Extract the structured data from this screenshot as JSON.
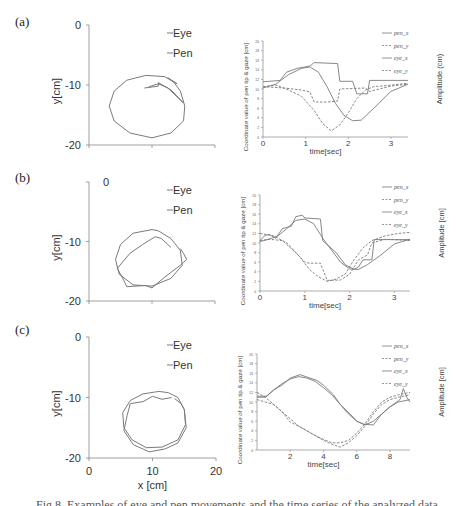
{
  "figure": {
    "caption": "Fig.8. Examples of eye and pen movements and the time series of the analyzed data"
  },
  "panels": [
    {
      "label": "(a)"
    },
    {
      "label": "(b)"
    },
    {
      "label": "(c)"
    }
  ],
  "chart_data": [
    {
      "id": "a-trajectory",
      "type": "line",
      "title": "",
      "xlabel": "",
      "ylabel": "y[cm]",
      "xlim": [
        0,
        20
      ],
      "ylim": [
        -20,
        0
      ],
      "yticks": [
        "0",
        "-10",
        "-20"
      ],
      "xticks": [],
      "legend": [
        "Eye",
        "Pen"
      ],
      "legend_position": "upper-right",
      "series": [
        {
          "name": "Pen",
          "points": [
            [
              14,
              -9.8
            ],
            [
              12,
              -8.6
            ],
            [
              9,
              -8.4
            ],
            [
              6,
              -9.2
            ],
            [
              4,
              -11
            ],
            [
              3.2,
              -13.5
            ],
            [
              4,
              -16
            ],
            [
              6.5,
              -18
            ],
            [
              10,
              -18.8
            ],
            [
              13,
              -18
            ],
            [
              15,
              -16
            ],
            [
              15.2,
              -13.5
            ],
            [
              14.5,
              -11
            ],
            [
              13.5,
              -9.6
            ],
            [
              12.5,
              -8.8
            ]
          ]
        },
        {
          "name": "Eye",
          "points": [
            [
              8.8,
              -10.5
            ],
            [
              11,
              -10.2
            ],
            [
              11,
              -9.6
            ],
            [
              13,
              -10.8
            ],
            [
              15,
              -13
            ],
            [
              12.5,
              -10.5
            ],
            [
              11,
              -9.8
            ],
            [
              9.5,
              -10.3
            ]
          ]
        }
      ]
    },
    {
      "id": "a-timeseries",
      "type": "line",
      "title": "",
      "xlabel": "time[sec]",
      "ylabel": "Coordinate value of pen tip & gaze [cm]",
      "ylabel_right": "Amplitude (cm)",
      "xlim": [
        0,
        3.4
      ],
      "ylim": [
        0,
        20
      ],
      "xticks": [
        "0",
        "1",
        "2",
        "3"
      ],
      "yticks": [
        "0",
        "2",
        "4",
        "6",
        "8",
        "10",
        "12",
        "14",
        "16",
        "18",
        "20"
      ],
      "legend": [
        "pen_x",
        "pen_y",
        "eye_x",
        "eye_y"
      ],
      "legend_position": "upper-right",
      "series": [
        {
          "name": "pen_x",
          "style": "solid",
          "x": [
            0,
            0.4,
            0.55,
            0.8,
            1.1,
            1.2,
            1.75,
            1.8,
            2.1,
            2.2,
            2.45,
            2.5,
            3,
            3.4
          ],
          "values": [
            11.5,
            11.8,
            13.5,
            14.3,
            14.8,
            15.5,
            15.3,
            11.6,
            11.6,
            9,
            9,
            11.8,
            11.8,
            11.8
          ]
        },
        {
          "name": "pen_y",
          "style": "dashed",
          "x": [
            0,
            0.5,
            0.9,
            1.1,
            1.2,
            1.5,
            1.75,
            1.8,
            2.4,
            2.5,
            3,
            3.4
          ],
          "values": [
            10.5,
            10.2,
            9.8,
            9.4,
            7.3,
            7.3,
            7.5,
            10,
            10.2,
            9.5,
            10.6,
            11
          ]
        },
        {
          "name": "eye_x",
          "style": "solid",
          "x": [
            0,
            0.3,
            0.6,
            0.9,
            1.1,
            1.3,
            1.5,
            1.7,
            1.9,
            2.1,
            2.3,
            2.6,
            3,
            3.4
          ],
          "values": [
            10.2,
            11,
            13,
            14.3,
            14.6,
            13.5,
            10.5,
            7,
            4.5,
            3.4,
            3.5,
            6,
            9.5,
            11
          ]
        },
        {
          "name": "eye_y",
          "style": "dashed",
          "x": [
            0,
            0.3,
            0.6,
            0.9,
            1.2,
            1.4,
            1.6,
            1.8,
            2.0,
            2.2,
            2.4,
            2.6,
            3,
            3.4
          ],
          "values": [
            10.5,
            10.8,
            9.8,
            8.5,
            5.5,
            2.8,
            1.3,
            2.5,
            5,
            8,
            9.8,
            10.5,
            10.8,
            11.2
          ]
        }
      ]
    },
    {
      "id": "b-trajectory",
      "type": "line",
      "title": "",
      "xlabel": "",
      "ylabel": "y[cm]",
      "xlim": [
        0,
        20
      ],
      "ylim": [
        -20,
        0
      ],
      "yticks": [
        "0",
        "-10",
        "-20"
      ],
      "xticks": [],
      "legend": [
        "Eye",
        "Pen"
      ],
      "legend_position": "upper-right",
      "series": [
        {
          "name": "Pen",
          "points": [
            [
              10,
              -8
            ],
            [
              7,
              -8.6
            ],
            [
              5,
              -10.5
            ],
            [
              4.2,
              -13
            ],
            [
              4.8,
              -15.5
            ],
            [
              7,
              -17.3
            ],
            [
              10,
              -17.5
            ],
            [
              13,
              -16.2
            ],
            [
              14.8,
              -14
            ],
            [
              14.5,
              -11.5
            ],
            [
              13,
              -9.5
            ],
            [
              11,
              -8.2
            ]
          ]
        },
        {
          "name": "Eye",
          "points": [
            [
              13,
              -11
            ],
            [
              11.5,
              -9.5
            ],
            [
              10.5,
              -9.2
            ],
            [
              8.5,
              -10.5
            ],
            [
              6.5,
              -12
            ],
            [
              4.5,
              -14.5
            ],
            [
              5.5,
              -16.5
            ],
            [
              6,
              -17.6
            ],
            [
              9,
              -17.4
            ],
            [
              10,
              -17.8
            ],
            [
              12,
              -16
            ],
            [
              14.5,
              -14
            ],
            [
              15.5,
              -13
            ],
            [
              15,
              -12
            ],
            [
              14.5,
              -11.2
            ]
          ]
        }
      ]
    },
    {
      "id": "b-timeseries",
      "type": "line",
      "title": "",
      "xlabel": "time[sec]",
      "ylabel": "Coordinate value of pen tip & gaze [cm]",
      "ylabel_right": "Amplitude [cm]",
      "xlim": [
        0,
        3.35
      ],
      "ylim": [
        0,
        20
      ],
      "xticks": [
        "0",
        "1",
        "2",
        "3"
      ],
      "yticks": [
        "0",
        "2",
        "4",
        "6",
        "8",
        "10",
        "12",
        "14",
        "16",
        "18",
        "20"
      ],
      "legend": [
        "pen_x",
        "pen_y",
        "eye_x",
        "eye_y"
      ],
      "legend_position": "upper-right",
      "series": [
        {
          "name": "pen_x",
          "style": "solid",
          "x": [
            0,
            0.1,
            0.2,
            0.35,
            0.5,
            0.7,
            0.8,
            0.95,
            1.0,
            1.35,
            1.4,
            1.7,
            1.9,
            2.1,
            2.2,
            2.3,
            2.5,
            2.55,
            3,
            3.35
          ],
          "values": [
            10.5,
            11.5,
            11.8,
            11,
            13,
            13.5,
            15.5,
            15.8,
            15.2,
            15,
            10.5,
            8,
            5.5,
            4.5,
            5,
            6.5,
            6.5,
            10.7,
            10.7,
            10.7
          ]
        },
        {
          "name": "pen_y",
          "style": "dashed",
          "x": [
            0,
            0.2,
            0.5,
            0.8,
            1.0,
            1.1,
            1.35,
            1.5,
            1.8,
            2.0,
            2.2,
            2.4,
            2.5,
            2.8,
            3.35
          ],
          "values": [
            10.5,
            10.8,
            10.5,
            8,
            6,
            5.8,
            5.8,
            2.2,
            2.3,
            3.5,
            6.5,
            7.5,
            10,
            10.8,
            10.5
          ]
        },
        {
          "name": "eye_x",
          "style": "solid",
          "x": [
            0,
            0.2,
            0.4,
            0.6,
            0.8,
            1.0,
            1.2,
            1.4,
            1.6,
            1.8,
            2.0,
            2.2,
            2.4,
            2.7,
            3.0,
            3.35
          ],
          "values": [
            10.3,
            10.8,
            11.5,
            13,
            14.7,
            15,
            14,
            11,
            8.5,
            6,
            4.6,
            4.5,
            5.5,
            7.5,
            9.8,
            10.8
          ]
        },
        {
          "name": "eye_y",
          "style": "dashed",
          "x": [
            0,
            0.3,
            0.6,
            0.9,
            1.1,
            1.3,
            1.5,
            1.7,
            1.9,
            2.1,
            2.3,
            2.5,
            2.8,
            3.1,
            3.35
          ],
          "values": [
            12,
            11.5,
            10,
            7,
            4.5,
            3,
            2,
            2.5,
            3.5,
            6.5,
            9,
            10.5,
            11.5,
            12,
            12.2
          ]
        }
      ]
    },
    {
      "id": "c-trajectory",
      "type": "line",
      "title": "",
      "xlabel": "x [cm]",
      "ylabel": "y[cm]",
      "xlim": [
        0,
        20
      ],
      "ylim": [
        -20,
        0
      ],
      "xticks": [
        "0",
        "10",
        "20"
      ],
      "yticks": [
        "0",
        "-10",
        "-20"
      ],
      "legend": [
        "Eye",
        "Pen"
      ],
      "legend_position": "upper-right",
      "series": [
        {
          "name": "Pen",
          "points": [
            [
              11,
              -9
            ],
            [
              8.5,
              -9.4
            ],
            [
              6.5,
              -10.5
            ],
            [
              5.3,
              -12.5
            ],
            [
              5.5,
              -15
            ],
            [
              6.8,
              -17
            ],
            [
              9,
              -18.3
            ],
            [
              11.5,
              -18.2
            ],
            [
              14,
              -17
            ],
            [
              15.2,
              -14.5
            ],
            [
              15,
              -12
            ],
            [
              14,
              -10
            ],
            [
              12.5,
              -9.2
            ]
          ]
        },
        {
          "name": "Eye",
          "points": [
            [
              13,
              -10
            ],
            [
              11.5,
              -10.3
            ],
            [
              10,
              -9.8
            ],
            [
              8.5,
              -10.7
            ],
            [
              6.5,
              -11
            ],
            [
              6,
              -13
            ],
            [
              5.5,
              -15.5
            ],
            [
              7,
              -17.8
            ],
            [
              9.5,
              -19
            ],
            [
              12,
              -18.5
            ],
            [
              14,
              -17.5
            ],
            [
              15.3,
              -15
            ],
            [
              15,
              -12
            ],
            [
              14.5,
              -11
            ],
            [
              13.5,
              -10.2
            ]
          ]
        }
      ]
    },
    {
      "id": "c-timeseries",
      "type": "line",
      "title": "",
      "xlabel": "time[sec]",
      "ylabel": "Coordinate value of pen tip & gaze [cm]",
      "ylabel_right": "Amplitude [cm]",
      "xlim": [
        0,
        9.2
      ],
      "ylim": [
        0,
        20
      ],
      "xticks": [
        "2",
        "4",
        "6",
        "8"
      ],
      "yticks": [
        "0",
        "2",
        "4",
        "6",
        "8",
        "10",
        "12",
        "14",
        "16",
        "18",
        "20"
      ],
      "legend": [
        "pen_x",
        "pen_y",
        "eye_x",
        "eye_y"
      ],
      "legend_position": "upper-right",
      "series": [
        {
          "name": "pen_x",
          "style": "solid",
          "x": [
            0,
            0.6,
            1,
            1.5,
            2,
            2.6,
            3,
            3.6,
            4,
            4.6,
            5,
            5.6,
            6,
            6.4,
            7,
            7.5,
            8,
            8.6,
            8.8,
            9.0,
            9.2
          ],
          "values": [
            11.2,
            11.2,
            12.5,
            13.5,
            15,
            15.7,
            15.2,
            14.5,
            13.5,
            11.5,
            9.5,
            7.5,
            6,
            5.4,
            5.2,
            7.5,
            9,
            10.5,
            12.8,
            11,
            10
          ]
        },
        {
          "name": "pen_y",
          "style": "dashed",
          "x": [
            0,
            0.5,
            1,
            1.5,
            2,
            2.5,
            3,
            3.5,
            4,
            4.5,
            5,
            5.5,
            6,
            6.5,
            7,
            7.5,
            8,
            8.5,
            9.2
          ],
          "values": [
            10.5,
            10,
            9.5,
            8,
            5.8,
            5,
            4,
            3,
            2,
            1.2,
            0.6,
            1.5,
            3,
            5,
            7.5,
            9.5,
            10.5,
            11,
            11.5
          ]
        },
        {
          "name": "eye_x",
          "style": "solid",
          "x": [
            0,
            0.5,
            1,
            1.5,
            2,
            2.5,
            3,
            3.5,
            4,
            4.5,
            5,
            5.5,
            6,
            6.5,
            7,
            7.5,
            8,
            8.5,
            9.2
          ],
          "values": [
            11,
            11,
            12.5,
            13.8,
            14.8,
            15.3,
            15,
            14.3,
            13,
            11.5,
            9.5,
            7.5,
            6,
            5.2,
            6,
            7.5,
            9,
            10,
            10.5
          ]
        },
        {
          "name": "eye_y",
          "style": "dashed",
          "x": [
            0,
            0.5,
            1,
            1.5,
            2,
            2.5,
            3,
            3.5,
            4,
            4.5,
            5,
            5.5,
            6,
            6.5,
            7,
            7.5,
            8,
            8.5,
            9.2
          ],
          "values": [
            12,
            11,
            9.5,
            8,
            6.5,
            5,
            4,
            3,
            2.2,
            1.5,
            1.5,
            2,
            3.5,
            5.5,
            8,
            10,
            11,
            11.5,
            12
          ]
        }
      ]
    }
  ]
}
